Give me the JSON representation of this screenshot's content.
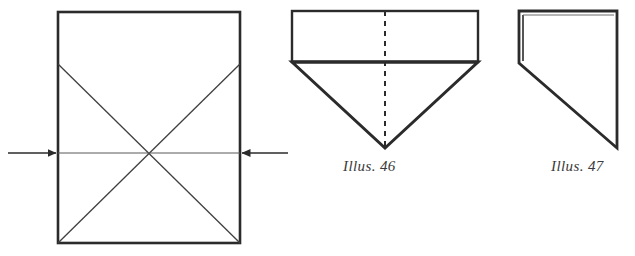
{
  "page": {
    "background_color": "#ffffff",
    "ink_color": "#2b2b2b",
    "thin_line_color": "#4a4a4a",
    "width": 635,
    "height": 256
  },
  "figures": [
    {
      "id": "figure-unlabeled-square",
      "name": "square-with-diagonals",
      "caption": "",
      "description": "Upright rectangle with an X of crease lines and two opposing arrows on the horizontal midline",
      "shapes": {
        "rectangle": {
          "x": 58,
          "y": 12,
          "width": 182,
          "height": 231
        },
        "diagonal_1": {
          "x1": 58,
          "y1": 64,
          "x2": 240,
          "y2": 243
        },
        "diagonal_2": {
          "x1": 240,
          "y1": 64,
          "x2": 58,
          "y2": 243
        },
        "midline": {
          "x1": 58,
          "y1": 153,
          "x2": 240,
          "y2": 153
        },
        "crossing_point": {
          "x": 149,
          "y": 153
        }
      },
      "arrows": [
        {
          "name": "arrow-left-pointing-right",
          "direction": "right",
          "x1": 8,
          "y1": 153,
          "x2": 58,
          "y2": 153
        },
        {
          "name": "arrow-right-pointing-left",
          "direction": "left",
          "x1": 288,
          "y1": 153,
          "x2": 240,
          "y2": 153
        }
      ]
    },
    {
      "id": "figure-illus-46",
      "name": "folded-point-down-figure",
      "caption": "Illus. 46",
      "description": "Wide rectangle above an inverted triangle, with a vertical dashed centre fold line",
      "shapes": {
        "rectangle": {
          "x": 292,
          "y": 11,
          "width": 186,
          "height": 51
        },
        "triangle": {
          "apex_x": 385,
          "apex_y": 148,
          "left_x": 292,
          "left_y": 62,
          "right_x": 478,
          "right_y": 62
        },
        "dashed_center_line": {
          "x": 385,
          "y1": 11,
          "y2": 148,
          "dash": "5 5"
        }
      }
    },
    {
      "id": "figure-illus-47",
      "name": "folded-half-figure",
      "caption": "Illus. 47",
      "description": "Half-fold result: vertical left edge, long diagonal down to a bottom point, tall right edge",
      "shapes": {
        "outline_points": "519,11 617,11 617,148 519,63",
        "inner_crease": {
          "x1": 522,
          "y1": 14,
          "x2": 522,
          "y2": 62
        }
      }
    }
  ],
  "captions": {
    "illus_46": "Illus. 46",
    "illus_47": "Illus. 47"
  }
}
